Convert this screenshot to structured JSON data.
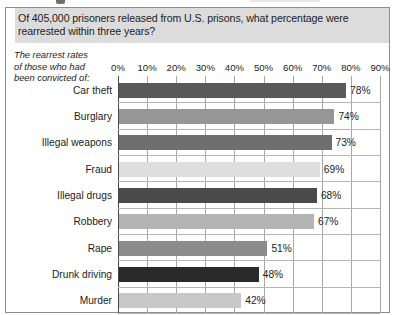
{
  "figure": {
    "title": "Of 405,000 prisoners released from U.S. prisons, what percentage were rearrested within three years?",
    "caption_lines": [
      "The rearrest rates",
      "of those who had",
      "been convicted of:"
    ],
    "frame_color": "#8c8c8c",
    "title_band_color": "#dcdcdc"
  },
  "chart_data": {
    "type": "bar",
    "orientation": "horizontal",
    "title": "Of 405,000 prisoners released from U.S. prisons, what percentage were rearrested within three years?",
    "subtitle": "The rearrest rates of those who had been convicted of:",
    "xlabel": "",
    "ylabel": "",
    "xlim": [
      0,
      90
    ],
    "grid": true,
    "legend": "none",
    "unit": "%",
    "xticks": [
      0,
      10,
      20,
      30,
      40,
      50,
      60,
      70,
      80,
      90
    ],
    "xticklabels": [
      "0%",
      "10%",
      "20%",
      "30%",
      "40%",
      "50%",
      "60%",
      "70%",
      "80%",
      "90%"
    ],
    "categories": [
      "Car theft",
      "Burglary",
      "Illegal weapons",
      "Fraud",
      "Illegal drugs",
      "Robbery",
      "Rape",
      "Drunk driving",
      "Murder"
    ],
    "values": [
      78,
      74,
      73,
      69,
      68,
      67,
      51,
      48,
      42
    ],
    "data_labels": [
      "78%",
      "74%",
      "73%",
      "69%",
      "68%",
      "67%",
      "51%",
      "48%",
      "42%"
    ],
    "bar_colors": [
      "#595959",
      "#969696",
      "#6e6e6e",
      "#dedede",
      "#4a4a4a",
      "#b4b4b4",
      "#8c8c8c",
      "#2a2a2a",
      "#c8c8c8"
    ]
  }
}
